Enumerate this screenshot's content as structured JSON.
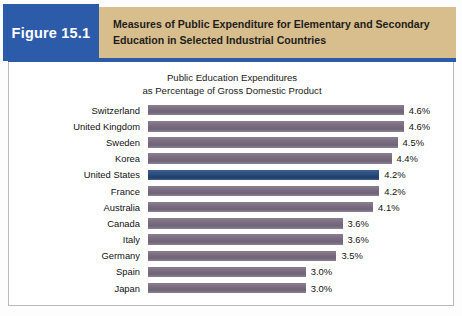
{
  "header": {
    "figure_tag": "Figure 15.1",
    "title_line1": "Measures of Public Expenditure for Elementary and Secondary",
    "title_line2": "Education in Selected Industrial Countries",
    "tag_bg": "#2c5baa",
    "band_bg": "#d8bd8d",
    "rule_color": "#2c5baa"
  },
  "chart_data": {
    "type": "bar",
    "orientation": "horizontal",
    "title": "Public Education Expenditures\nas Percentage of Gross Domestic Product",
    "title_line1": "Public Education Expenditures",
    "title_line2": "as Percentage of Gross Domestic Product",
    "xlabel": "",
    "ylabel": "",
    "grid": false,
    "legend": "none",
    "xlim": [
      0,
      4.6
    ],
    "value_suffix": "%",
    "bar_color": "#7c6f83",
    "highlight_color": "#2c4f7e",
    "highlight_category": "United States",
    "categories": [
      "Switzerland",
      "United Kingdom",
      "Sweden",
      "Korea",
      "United States",
      "France",
      "Australia",
      "Canada",
      "Italy",
      "Germany",
      "Spain",
      "Japan"
    ],
    "values": [
      4.6,
      4.6,
      4.5,
      4.4,
      4.2,
      4.2,
      4.1,
      3.6,
      3.6,
      3.5,
      3.0,
      3.0
    ],
    "value_labels": [
      "4.6%",
      "4.6%",
      "4.5%",
      "4.4%",
      "4.2%",
      "4.2%",
      "4.1%",
      "3.6%",
      "3.6%",
      "3.5%",
      "3.0%",
      "3.0%"
    ],
    "bars": [
      {
        "category": "Switzerland",
        "value": 4.6,
        "label": "4.6%",
        "highlighted": false
      },
      {
        "category": "United Kingdom",
        "value": 4.6,
        "label": "4.6%",
        "highlighted": false
      },
      {
        "category": "Sweden",
        "value": 4.5,
        "label": "4.5%",
        "highlighted": false
      },
      {
        "category": "Korea",
        "value": 4.4,
        "label": "4.4%",
        "highlighted": false
      },
      {
        "category": "United States",
        "value": 4.2,
        "label": "4.2%",
        "highlighted": true
      },
      {
        "category": "France",
        "value": 4.2,
        "label": "4.2%",
        "highlighted": false
      },
      {
        "category": "Australia",
        "value": 4.1,
        "label": "4.1%",
        "highlighted": false
      },
      {
        "category": "Canada",
        "value": 3.6,
        "label": "3.6%",
        "highlighted": false
      },
      {
        "category": "Italy",
        "value": 3.6,
        "label": "3.6%",
        "highlighted": false
      },
      {
        "category": "Germany",
        "value": 3.5,
        "label": "3.5%",
        "highlighted": false
      },
      {
        "category": "Spain",
        "value": 3.0,
        "label": "3.0%",
        "highlighted": false
      },
      {
        "category": "Japan",
        "value": 3.0,
        "label": "3.0%",
        "highlighted": false
      }
    ]
  }
}
